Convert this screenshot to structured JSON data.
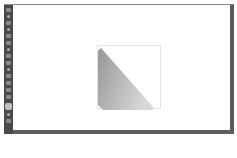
{
  "app": {
    "toolbar": {
      "tools": [
        {
          "icon": "select-icon"
        },
        {
          "icon": "direct-select-icon"
        },
        {
          "icon": "pen-icon"
        },
        {
          "icon": "type-icon"
        },
        {
          "icon": "line-icon"
        },
        {
          "icon": "rectangle-icon"
        },
        {
          "icon": "brush-icon"
        },
        {
          "icon": "pencil-icon"
        },
        {
          "icon": "rotate-icon"
        },
        {
          "icon": "scale-icon"
        },
        {
          "icon": "warp-icon"
        },
        {
          "icon": "shape-builder-icon"
        },
        {
          "icon": "gradient-icon"
        },
        {
          "icon": "eyedropper-icon"
        },
        {
          "icon": "blend-icon"
        },
        {
          "icon": "fill-stroke-icon",
          "active": true
        },
        {
          "icon": "draw-mode-icon"
        },
        {
          "icon": "screen-mode-icon"
        }
      ]
    },
    "canvas": {
      "background": "#ffffff",
      "object": {
        "type": "half-circle",
        "fill": "gradient",
        "gradient_colors": [
          "#8c8c8c",
          "#d6d6d6"
        ],
        "selected": true
      }
    },
    "statusbar": {
      "text": ""
    }
  }
}
